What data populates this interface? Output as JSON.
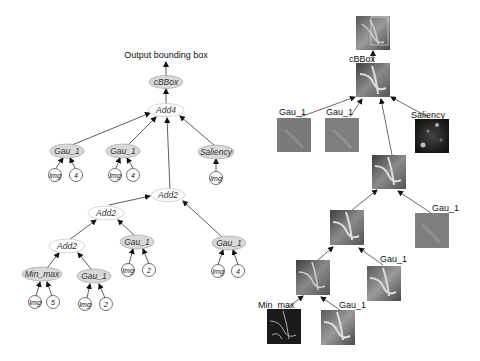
{
  "left_tree": {
    "output_label": "Output bounding box",
    "nodes": {
      "cbbox": "cBBox",
      "add4": "Add4",
      "gau1_a": "Gau_1",
      "gau1_a_img": "Img",
      "gau1_a_param": "4",
      "gau1_b": "Gau_1",
      "gau1_b_img": "Img",
      "gau1_b_param": "4",
      "saliency": "Saliency",
      "saliency_img": "Img",
      "add2_top": "Add2",
      "add2_mid": "Add2",
      "gau1_c": "Gau_1",
      "gau1_c_img": "Img",
      "gau1_c_param": "2",
      "gau1_d": "Gau_1",
      "gau1_d_img": "Img",
      "gau1_d_param": "4",
      "add2_low": "Add2",
      "minmax": "Min_max",
      "minmax_img": "Img",
      "minmax_param": "5",
      "gau1_e": "Gau_1",
      "gau1_e_img": "Img",
      "gau1_e_param": "2"
    }
  },
  "right_tree": {
    "labels": {
      "cbbox": "cBBox",
      "gau1_a": "Gau_1",
      "gau1_b": "Gau_1",
      "saliency": "Saliency",
      "gau1_d": "Gau_1",
      "gau1_c": "Gau_1",
      "minmax": "Min_max",
      "gau1_e": "Gau_1"
    }
  },
  "colors": {
    "function_node_fill": "#d9d9d9",
    "add_node_fill": "#ffffff",
    "edge": "#333333",
    "node_stroke": "#999999"
  }
}
